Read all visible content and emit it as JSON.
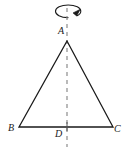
{
  "figure": {
    "background_color": "#ffffff",
    "stroke_color": "#1a1a1a",
    "dash_color": "#8c8c8c",
    "labels": {
      "apex": "A",
      "base_left": "B",
      "base_right": "C",
      "foot": "D"
    },
    "geometry": {
      "apex_point": [
        67,
        41
      ],
      "base_left_point": [
        19,
        127
      ],
      "base_right_point": [
        113,
        127
      ],
      "foot_point": [
        67,
        127
      ],
      "axis_top": [
        67,
        8
      ],
      "axis_bottom": [
        67,
        147
      ]
    },
    "rotation_arrow": {
      "name": "rotation-arrow",
      "center": [
        68,
        11
      ],
      "radius_x": 13,
      "radius_y": 6
    }
  }
}
